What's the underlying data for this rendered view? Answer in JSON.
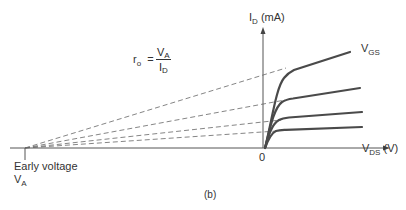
{
  "figure": {
    "caption": "(b)",
    "y_axis": {
      "symbol": "I",
      "sub": "D",
      "unit": "(mA)"
    },
    "x_axis": {
      "symbol": "V",
      "sub": "DS",
      "unit": "(V)"
    },
    "origin_label": "0",
    "curve_label": {
      "symbol": "V",
      "sub": "GS"
    },
    "early_voltage": {
      "text": "Early voltage",
      "symbol": "V",
      "sub": "A"
    },
    "formula": {
      "lhs_symbol": "r",
      "lhs_sub": "o",
      "equals": "=",
      "num_symbol": "V",
      "num_sub": "A",
      "den_symbol": "I",
      "den_sub": "D"
    },
    "colors": {
      "curve": "#4a4a4a",
      "axis": "#555555",
      "dashed": "#666666"
    },
    "curves": [
      {
        "name": "vgs-1",
        "knee": [
          286,
          76
        ],
        "end": [
          350,
          52
        ],
        "y_intercept": 75
      },
      {
        "name": "vgs-2",
        "knee": [
          285,
          101
        ],
        "end": [
          360,
          88
        ],
        "y_intercept": 104
      },
      {
        "name": "vgs-3",
        "knee": [
          281,
          120
        ],
        "end": [
          362,
          112
        ],
        "y_intercept": 122
      },
      {
        "name": "vgs-4",
        "knee": [
          277,
          131
        ],
        "end": [
          362,
          127
        ],
        "y_intercept": 132
      }
    ]
  }
}
